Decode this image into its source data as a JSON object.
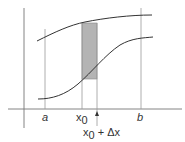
{
  "diagram": {
    "labels": {
      "a": "a",
      "b": "b",
      "x0_base": "x",
      "x0_sub": "0",
      "x0dx_base": "x",
      "x0dx_sub": "0",
      "x0dx_rest": " + Δx"
    },
    "colors": {
      "line": "#333333",
      "guide": "#888888",
      "strip_fill": "#b0b0b0",
      "strip_stroke": "#777777"
    }
  }
}
